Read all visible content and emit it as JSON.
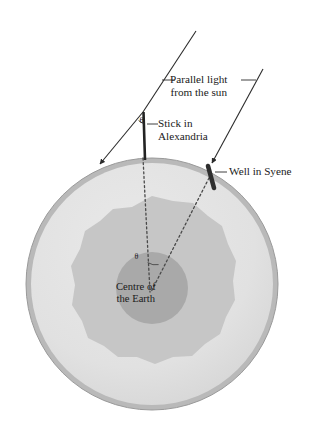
{
  "diagram": {
    "labels": {
      "parallel_light_line1": "Parallel light",
      "parallel_light_line2": "from the sun",
      "stick_line1": "Stick in",
      "stick_line2": "Alexandria",
      "well": "Well in Syene",
      "centre_line1": "Centre of",
      "centre_line2": "the Earth"
    },
    "angles": {
      "at_stick": "θ",
      "at_centre": "θ"
    },
    "colors": {
      "background": "#ffffff",
      "earth_rim": "#b4b4b4",
      "earth_surface": "#e2e2e2",
      "mantle": "#c3c3c3",
      "core": "#a8a8a8",
      "ink": "#1a1a1a",
      "ray": "#2b2b2b",
      "dotted": "#555555",
      "marker": "#2e2e2e"
    },
    "geometry": {
      "earth_center_x": 152,
      "earth_center_y": 284,
      "earth_radius": 126,
      "stick_top_x": 143,
      "stick_top_y": 112,
      "stick_base_y": 158,
      "well_x": 211,
      "well_y": 170
    },
    "elements": {
      "sun_ray_left": "parallel-sun-ray-left",
      "sun_ray_right": "parallel-sun-ray-right",
      "stick": "stick-in-alexandria",
      "well": "well-in-syene",
      "dotted_stick_to_centre": "dotted-radius-alexandria",
      "dotted_well_to_centre": "dotted-radius-syene"
    }
  }
}
